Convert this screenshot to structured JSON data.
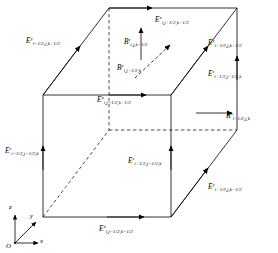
{
  "figure": {
    "colors": {
      "line": "#000000",
      "background": "#ffffff",
      "text": "#000000"
    }
  },
  "axes": {
    "origin_label": "O",
    "x_label": "x",
    "y_label": "y",
    "z_label": "z"
  },
  "labels": [
    {
      "id": "E-y-top-left",
      "base": "E",
      "sup": "y",
      "sub": "i−1/2,j,k+1/2",
      "x": 26,
      "y": 38
    },
    {
      "id": "E-x-top-back",
      "base": "E",
      "sup": "x",
      "sub": "i,j+1/2,k+1/2",
      "x": 155,
      "y": 17
    },
    {
      "id": "E-y-top-right",
      "base": "E",
      "sup": "y",
      "sub": "i+1/2,j,k+1/2",
      "x": 208,
      "y": 40
    },
    {
      "id": "B-z-center",
      "base": "B",
      "sup": "z",
      "sub": "i,j,k−1/2",
      "x": 124,
      "y": 39
    },
    {
      "id": "B-y-diagonal",
      "base": "B",
      "sup": "y",
      "sub": "i,j+1/2,k",
      "x": 117,
      "y": 65
    },
    {
      "id": "E-z-right-upper",
      "base": "E",
      "sup": "z",
      "sub": "i+1/2,j+1/2,k",
      "x": 208,
      "y": 71
    },
    {
      "id": "E-x-mid-front",
      "base": "E",
      "sup": "x",
      "sub": "i,j−1/2,k+1/2",
      "x": 97,
      "y": 97
    },
    {
      "id": "B-x-right",
      "base": "B",
      "sup": "x",
      "sub": "i+1/2,j,k",
      "x": 226,
      "y": 113
    },
    {
      "id": "E-z-left-front",
      "base": "E",
      "sup": "z",
      "sub": "i−1/2,j−1/2,k",
      "x": 5,
      "y": 148
    },
    {
      "id": "E-z-mid-front",
      "base": "E",
      "sup": "z",
      "sub": "i+1/2,j−1/2,k",
      "x": 128,
      "y": 158
    },
    {
      "id": "E-y-bottom-right",
      "base": "E",
      "sup": "y",
      "sub": "i+1/2,j,k−1/2",
      "x": 208,
      "y": 184
    },
    {
      "id": "E-x-bottom-front",
      "base": "E",
      "sup": "x",
      "sub": "i,j−1/2,k−1/2",
      "x": 99,
      "y": 226
    }
  ]
}
